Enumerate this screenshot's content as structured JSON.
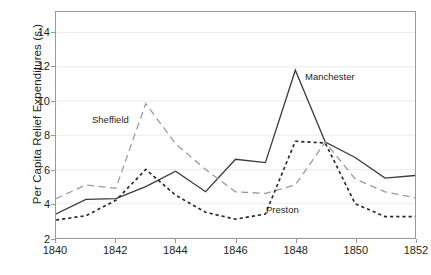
{
  "chart_data": {
    "type": "line",
    "title": "",
    "xlabel": "",
    "ylabel": "Per Capita Relief Expenditures (s.)",
    "x": [
      1840,
      1841,
      1842,
      1843,
      1844,
      1845,
      1846,
      1847,
      1848,
      1849,
      1850,
      1851,
      1852
    ],
    "xlim": [
      1840,
      1852
    ],
    "ylim": [
      2,
      15.2
    ],
    "xticks": [
      "1840",
      "1842",
      "1844",
      "1846",
      "1848",
      "1850",
      "1852"
    ],
    "xtick_values": [
      1840,
      1842,
      1844,
      1846,
      1848,
      1850,
      1852
    ],
    "yticks": [
      "2",
      "4",
      "6",
      "8",
      "10",
      "12",
      "14"
    ],
    "ytick_values": [
      2,
      4,
      6,
      8,
      10,
      12,
      14
    ],
    "grid": "horizontal",
    "legend": "inline-annotations",
    "series": [
      {
        "name": "Manchester",
        "style": "solid",
        "color": "#3a3a3a",
        "values": [
          3.4,
          4.25,
          4.3,
          5.0,
          5.9,
          4.7,
          6.6,
          6.4,
          11.8,
          7.6,
          6.7,
          5.5,
          5.65
        ]
      },
      {
        "name": "Sheffield",
        "style": "long-dash",
        "color": "#9b9b9b",
        "values": [
          4.3,
          5.1,
          4.9,
          9.85,
          7.5,
          6.0,
          4.7,
          4.6,
          5.1,
          7.6,
          5.45,
          4.7,
          4.35
        ]
      },
      {
        "name": "Preston",
        "style": "short-dash",
        "color": "#2b2b2b",
        "values": [
          3.05,
          3.3,
          4.2,
          6.0,
          4.5,
          3.5,
          3.1,
          3.4,
          7.65,
          7.55,
          4.0,
          3.25,
          3.25
        ]
      }
    ],
    "annotations": [
      {
        "text": "Sheffield",
        "series": "Sheffield"
      },
      {
        "text": "Manchester",
        "series": "Manchester"
      },
      {
        "text": "Preston",
        "series": "Preston"
      }
    ],
    "colors": {
      "axis": "#9a9a9a",
      "grid": "#ececec",
      "text": "#231f20",
      "background": "#ffffff"
    }
  }
}
